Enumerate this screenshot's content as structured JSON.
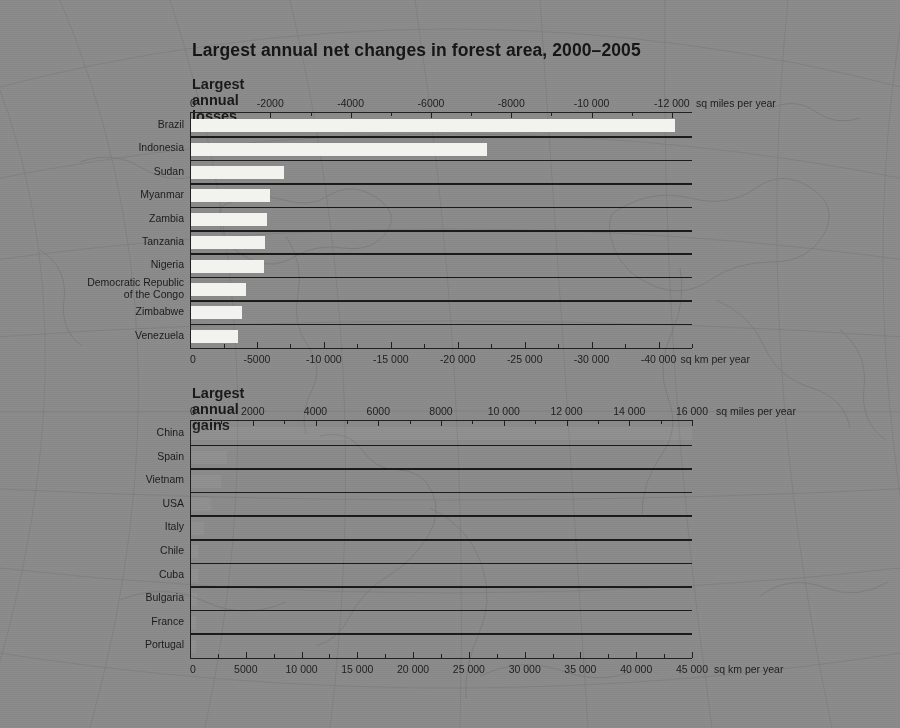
{
  "page": {
    "title": "Largest annual net changes in forest area, 2000–2005",
    "background_color": "#8a8a8a",
    "bar_color": "#f2f2ee",
    "ink_color": "#1d1d1d"
  },
  "chart_data": [
    {
      "type": "bar",
      "orientation": "horizontal",
      "title": "Largest annual losses",
      "xlabel_top": "sq miles per year",
      "xlabel_bottom": "sq km per year",
      "ylabel": "",
      "grid": false,
      "legend": "none",
      "top_axis": {
        "unit": "sq miles per year",
        "ticks": [
          "0",
          "-2000",
          "-4000",
          "-6000",
          "-8000",
          "-10 000",
          "-12 000"
        ],
        "values": [
          0,
          -2000,
          -4000,
          -6000,
          -8000,
          -10000,
          -12000
        ],
        "minor_step": 1000,
        "range": [
          0,
          -12500
        ]
      },
      "bottom_axis": {
        "unit": "sq km per year",
        "ticks": [
          "0",
          "-5000",
          "-10 000",
          "-15 000",
          "-20 000",
          "-25 000",
          "-30 000",
          "-40 000"
        ],
        "values": [
          0,
          -5000,
          -10000,
          -15000,
          -20000,
          -25000,
          -30000,
          -35000
        ],
        "minor_step": 2500,
        "range": [
          0,
          -37500
        ]
      },
      "categories": [
        "Brazil",
        "Indonesia",
        "Sudan",
        "Myanmar",
        "Zambia",
        "Tanzania",
        "Nigeria",
        "Democratic Republic|of the Congo",
        "Zimbabwe",
        "Venezuela"
      ],
      "values_sq_miles": [
        -12060,
        -7360,
        -2320,
        -1970,
        -1900,
        -1840,
        -1810,
        -1360,
        -1280,
        -1160
      ],
      "values_sq_km": [
        -31240,
        -19070,
        -6010,
        -5110,
        -4920,
        -4770,
        -4690,
        -3520,
        -3310,
        -3000
      ]
    },
    {
      "type": "bar",
      "orientation": "horizontal",
      "title": "Largest annual gains",
      "xlabel_top": "sq miles per year",
      "xlabel_bottom": "sq km per year",
      "ylabel": "",
      "grid": false,
      "legend": "none",
      "top_axis": {
        "unit": "sq miles per year",
        "ticks": [
          "0",
          "2000",
          "4000",
          "6000",
          "8000",
          "10 000",
          "12 000",
          "14 000",
          "16 000"
        ],
        "values": [
          0,
          2000,
          4000,
          6000,
          8000,
          10000,
          12000,
          14000,
          16000
        ],
        "minor_step": 1000,
        "range": [
          0,
          16000
        ]
      },
      "bottom_axis": {
        "unit": "sq km per year",
        "ticks": [
          "0",
          "5000",
          "10 000",
          "15 000",
          "20 000",
          "25 000",
          "30 000",
          "35 000",
          "40 000",
          "45 000"
        ],
        "values": [
          0,
          5000,
          10000,
          15000,
          20000,
          25000,
          30000,
          35000,
          40000,
          45000
        ],
        "minor_step": 2500,
        "range": [
          0,
          45000
        ]
      },
      "categories": [
        "China",
        "Spain",
        "Vietnam",
        "USA",
        "Italy",
        "Chile",
        "Cuba",
        "Bulgaria",
        "France",
        "Portugal"
      ],
      "values_sq_miles": [
        15980,
        1150,
        950,
        620,
        410,
        220,
        220,
        190,
        160,
        150
      ],
      "values_sq_km": [
        40580,
        2960,
        2410,
        1590,
        1060,
        570,
        560,
        500,
        410,
        400
      ],
      "note": "Bars in this panel are rendered nearly flat/invisible in the source image; only row separator rules are visible."
    }
  ]
}
